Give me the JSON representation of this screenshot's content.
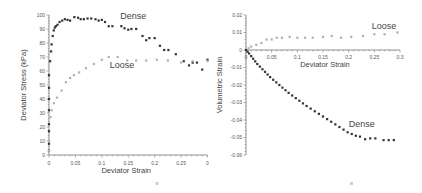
{
  "chart_data": [
    {
      "type": "scatter",
      "title": "",
      "xlabel": "Deviator Strain",
      "ylabel": "Deviator Stress (kPa)",
      "xlim": [
        0,
        0.3
      ],
      "ylim": [
        0,
        100
      ],
      "xticks": [
        "0",
        "0.05",
        "0.1",
        "0.15",
        "0.2",
        "0.25",
        "0"
      ],
      "yticks": [
        "0",
        "10",
        "20",
        "30",
        "40",
        "50",
        "60",
        "70",
        "80",
        "90",
        "100"
      ],
      "grid": false,
      "series": [
        {
          "name": "Dense",
          "color": "#333333",
          "label_pos": [
            0.135,
            97
          ],
          "x": [
            0,
            0,
            0,
            0,
            0,
            0,
            0,
            0,
            0.002,
            0.004,
            0.005,
            0.007,
            0.009,
            0.011,
            0.013,
            0.016,
            0.02,
            0.025,
            0.03,
            0.035,
            0.04,
            0.048,
            0.055,
            0.06,
            0.066,
            0.073,
            0.08,
            0.088,
            0.094,
            0.1,
            0.106,
            0.113,
            0.12,
            0.137,
            0.143,
            0.15,
            0.156,
            0.165,
            0.177,
            0.184,
            0.19,
            0.2,
            0.21,
            0.218,
            0.226,
            0.24,
            0.255,
            0.265,
            0.272,
            0.28,
            0.29,
            0.3
          ],
          "y": [
            3,
            8,
            17,
            22,
            32,
            40,
            48,
            57,
            67,
            74,
            79,
            85,
            89,
            91,
            92,
            93,
            95,
            96,
            97,
            96.5,
            96,
            98.5,
            98,
            97,
            97,
            97.5,
            97.5,
            97,
            96,
            96.5,
            95,
            92,
            92,
            92,
            90.5,
            89.5,
            90,
            90,
            85,
            82,
            83.5,
            83.5,
            78,
            75,
            75,
            72,
            67,
            64,
            66,
            66,
            61,
            68
          ]
        },
        {
          "name": "Loose",
          "color": "#b0b0b0",
          "label_pos": [
            0.115,
            62
          ],
          "x": [
            0,
            0,
            0.003,
            0.005,
            0.009,
            0.015,
            0.024,
            0.032,
            0.04,
            0.047,
            0.057,
            0.07,
            0.085,
            0.1,
            0.113,
            0.13,
            0.148,
            0.165,
            0.184,
            0.204,
            0.225,
            0.25,
            0.272,
            0.3
          ],
          "y": [
            3,
            10,
            27,
            32,
            37,
            41,
            46,
            52,
            55,
            57,
            59,
            62,
            65,
            68,
            70,
            70,
            67.5,
            67.5,
            67.5,
            68,
            67.5,
            66,
            67,
            67
          ]
        }
      ]
    },
    {
      "type": "scatter",
      "title": "",
      "xlabel": "Deviator Strain",
      "ylabel": "Volumetric Strain",
      "xlim": [
        0,
        0.3
      ],
      "ylim": [
        -0.06,
        0.02
      ],
      "xticks": [
        "0",
        "0.05",
        "0.1",
        "0.15",
        "0.2",
        "0.25",
        "0.3"
      ],
      "yticks": [
        "-0.06",
        "-0.05",
        "-0.04",
        "-0.03",
        "-0.02",
        "-0.01",
        "0",
        "0.01",
        "0.02"
      ],
      "grid": false,
      "series": [
        {
          "name": "Loose",
          "color": "#b0b0b0",
          "label_pos": [
            0.245,
            0.012
          ],
          "x": [
            0,
            0.005,
            0.01,
            0.02,
            0.03,
            0.04,
            0.05,
            0.06,
            0.07,
            0.085,
            0.1,
            0.115,
            0.13,
            0.15,
            0.167,
            0.185,
            0.205,
            0.228,
            0.25,
            0.27,
            0.295
          ],
          "y": [
            0,
            0.001,
            0.002,
            0.003,
            0.004,
            0.006,
            0.006,
            0.007,
            0.007,
            0.0075,
            0.007,
            0.007,
            0.007,
            0.0075,
            0.008,
            0.007,
            0.0075,
            0.008,
            0.009,
            0.009,
            0.01
          ]
        },
        {
          "name": "Dense",
          "color": "#333333",
          "label_pos": [
            0.2,
            -0.044
          ],
          "x": [
            0,
            0.003,
            0.006,
            0.01,
            0.014,
            0.018,
            0.022,
            0.027,
            0.032,
            0.037,
            0.042,
            0.047,
            0.053,
            0.059,
            0.065,
            0.071,
            0.077,
            0.083,
            0.09,
            0.097,
            0.104,
            0.111,
            0.118,
            0.126,
            0.134,
            0.142,
            0.15,
            0.158,
            0.166,
            0.174,
            0.182,
            0.19,
            0.198,
            0.206,
            0.214,
            0.222,
            0.232,
            0.242,
            0.252,
            0.268,
            0.278,
            0.288
          ],
          "y": [
            0,
            -0.001,
            -0.002,
            -0.0035,
            -0.005,
            -0.0065,
            -0.008,
            -0.0095,
            -0.011,
            -0.0125,
            -0.014,
            -0.0155,
            -0.017,
            -0.0185,
            -0.02,
            -0.0215,
            -0.023,
            -0.0245,
            -0.026,
            -0.0275,
            -0.029,
            -0.0305,
            -0.032,
            -0.0335,
            -0.035,
            -0.0365,
            -0.038,
            -0.0395,
            -0.041,
            -0.0425,
            -0.044,
            -0.0455,
            -0.047,
            -0.048,
            -0.049,
            -0.0495,
            -0.051,
            -0.0505,
            -0.0505,
            -0.0515,
            -0.0515,
            -0.0515
          ]
        }
      ]
    }
  ]
}
